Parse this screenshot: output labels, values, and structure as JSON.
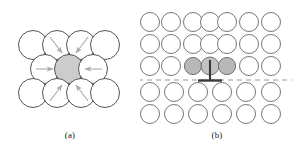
{
  "figure": {
    "background_color": "#ffffff",
    "panels": [
      {
        "id": "a",
        "caption": "(a)",
        "description": "close-packed atom cluster with vacancy-centred inward relaxation arrows",
        "atom_outline_color": "#4d4d4d",
        "atom_fill_color": "#ffffff",
        "highlight_fill_color": "#cccccc",
        "arrow_color": "#a6a6a6",
        "rows": [
          {
            "row": 1,
            "count": 4,
            "type": "open"
          },
          {
            "row": 2,
            "count": 3,
            "type": "open-with-centre-shaded"
          },
          {
            "row": 3,
            "count": 4,
            "type": "open"
          }
        ],
        "arrows": [
          {
            "from": "top-row-circle-2",
            "direction": "down-right"
          },
          {
            "from": "top-row-circle-3",
            "direction": "down-left"
          },
          {
            "from": "middle-row-left",
            "direction": "right"
          },
          {
            "from": "middle-row-right",
            "direction": "left"
          },
          {
            "from": "bottom-row-circle-2",
            "direction": "up-right"
          },
          {
            "from": "bottom-row-circle-3",
            "direction": "up-left"
          }
        ]
      },
      {
        "id": "b",
        "caption": "(b)",
        "description": "edge dislocation in a square lattice with extra half-plane and slip-plane trace",
        "atom_outline_color": "#4d4d4d",
        "atom_fill_color": "#ffffff",
        "highlight_fill_color": "#b3b3b3",
        "slip_plane_color": "#999999",
        "dislocation_symbol_color": "#333333",
        "grid_rows": 5,
        "grid_columns_upper": 7,
        "grid_columns_lower": 6,
        "shaded_atoms_row": 3,
        "shaded_atoms_count": 3,
        "dislocation_symbol": "inverted-tee",
        "slip_plane_style": "dashed"
      }
    ]
  }
}
